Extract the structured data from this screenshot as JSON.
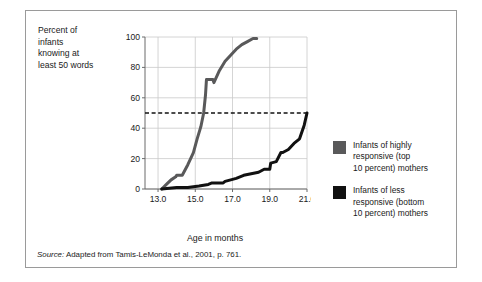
{
  "figure": {
    "y_axis_caption": "Percent of\ninfants\nknowing at\nleast 50 words",
    "x_axis_title": "Age in months",
    "source_label": "Source:",
    "source_text": " Adapted from Tamis-LeMonda et al., 2001, p. 761."
  },
  "legend": {
    "items": [
      {
        "label": "Infants of highly\nresponsive (top\n10 percent) mothers",
        "color": "#59595a",
        "swatch_name": "legend-swatch-highly-responsive"
      },
      {
        "label": "Infants of less\nresponsive (bottom\n10 percent) mothers",
        "color": "#111111",
        "swatch_name": "legend-swatch-less-responsive"
      }
    ]
  },
  "colors": {
    "gray_series": "#59595a",
    "black_series": "#111111",
    "grid": "#c9c9c9",
    "axis": "#6b6b6b",
    "frame": "#9a9a9a",
    "background": "#ffffff"
  },
  "chart_data": {
    "type": "line",
    "title": "",
    "xlabel": "Age in months",
    "ylabel": "Percent of infants knowing at least 50 words",
    "xlim": [
      12.3,
      21.0
    ],
    "ylim": [
      0,
      100
    ],
    "xticks": [
      "13.0",
      "15.0",
      "17.0",
      "19.0",
      "21.0"
    ],
    "xtick_values": [
      13.0,
      15.0,
      17.0,
      19.0,
      21.0
    ],
    "yticks": [
      "0",
      "20",
      "40",
      "60",
      "80",
      "100"
    ],
    "ytick_values": [
      0,
      20,
      40,
      60,
      80,
      100
    ],
    "grid": true,
    "legend_position": "right-outside",
    "annotations": [
      {
        "type": "hline",
        "y": 50,
        "style": "dashed",
        "color": "#111111",
        "note": "50 percent reference line"
      }
    ],
    "series": [
      {
        "name": "Infants of highly responsive (top 10 percent) mothers",
        "color": "#59595a",
        "x": [
          13.2,
          13.45,
          13.7,
          13.95,
          14.0,
          14.3,
          14.6,
          14.9,
          15.1,
          15.3,
          15.45,
          15.55,
          15.6,
          15.95,
          16.0,
          16.3,
          16.6,
          16.9,
          17.2,
          17.5,
          17.8,
          18.1,
          18.3
        ],
        "y": [
          0,
          3,
          6,
          8,
          9,
          9,
          16,
          24,
          33,
          41,
          50,
          62,
          72,
          72,
          70,
          78,
          84,
          88,
          92,
          95,
          97,
          99,
          99
        ]
      },
      {
        "name": "Infants of less responsive (bottom 10 percent) mothers",
        "color": "#111111",
        "x": [
          13.2,
          14.0,
          14.6,
          15.2,
          15.7,
          15.9,
          16.2,
          16.5,
          16.6,
          16.9,
          17.2,
          17.6,
          18.0,
          18.4,
          18.7,
          19.0,
          19.05,
          19.35,
          19.6,
          19.7,
          20.0,
          20.3,
          20.6,
          20.85,
          21.0
        ],
        "y": [
          0,
          1,
          1,
          2,
          3,
          4,
          4,
          4,
          5,
          6,
          7,
          9,
          10,
          11,
          13,
          13,
          17,
          18,
          24,
          24,
          26,
          30,
          33,
          42,
          50
        ]
      }
    ]
  }
}
